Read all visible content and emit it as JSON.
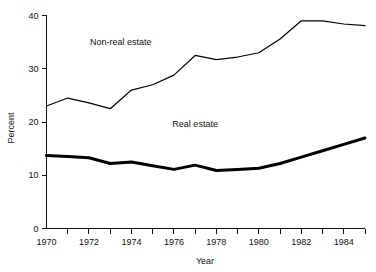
{
  "chart_data": {
    "type": "line",
    "title": "",
    "xlabel": "Year",
    "ylabel": "Percent",
    "xlim": [
      1970,
      1985
    ],
    "ylim": [
      0,
      40
    ],
    "grid": false,
    "legend_position": "inline-annotations",
    "x": [
      1970,
      1971,
      1972,
      1973,
      1974,
      1975,
      1976,
      1977,
      1978,
      1979,
      1980,
      1981,
      1982,
      1983,
      1984,
      1985
    ],
    "x_tick_values": [
      1970,
      1971,
      1972,
      1973,
      1974,
      1975,
      1976,
      1977,
      1978,
      1979,
      1980,
      1981,
      1982,
      1983,
      1984,
      1985
    ],
    "x_tick_labels": [
      "1970",
      "",
      "1972",
      "",
      "1974",
      "",
      "1976",
      "",
      "1978",
      "",
      "1980",
      "",
      "1982",
      "",
      "1984",
      ""
    ],
    "x_labeled_ticks": [
      "1970",
      "1972",
      "1974",
      "1976",
      "1978",
      "1980",
      "1982",
      "1984"
    ],
    "y_tick_values": [
      0,
      10,
      20,
      30,
      40
    ],
    "y_tick_labels": [
      "0",
      "10",
      "20",
      "30",
      "40"
    ],
    "series": [
      {
        "name": "Non-real estate",
        "values": [
          23.0,
          24.5,
          23.6,
          22.5,
          26.0,
          27.0,
          28.8,
          32.5,
          31.7,
          32.2,
          33.0,
          35.6,
          39.0,
          39.0,
          38.4,
          38.1
        ],
        "line_width": 1.2,
        "color": "#000000"
      },
      {
        "name": "Real estate",
        "values": [
          13.7,
          13.5,
          13.3,
          12.2,
          12.5,
          11.8,
          11.1,
          11.9,
          10.9,
          11.1,
          11.3,
          12.2,
          13.4,
          14.6,
          15.8,
          17.0
        ],
        "line_width": 3.0,
        "color": "#000000"
      }
    ],
    "annotations": [
      {
        "text": "Non-real estate",
        "x": 1973.5,
        "y": 34.5
      },
      {
        "text": "Real estate",
        "x": 1977.0,
        "y": 19.0
      }
    ]
  },
  "axes": {
    "y_title": "Percent",
    "x_title": "Year"
  }
}
